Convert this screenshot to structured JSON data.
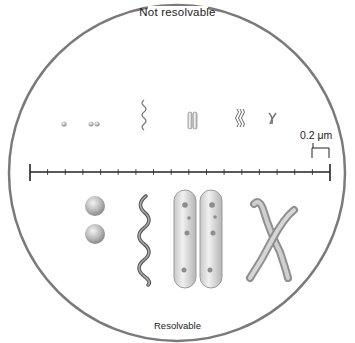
{
  "diagram": {
    "top_label": "Not resolvable",
    "bottom_label": "Resolvable",
    "scale_bar": {
      "label": "0.2 μm",
      "tick_count": 18,
      "bracket_marks_one_interval": true
    },
    "small_structures": [
      {
        "name": "single-coccus"
      },
      {
        "name": "diplococcus"
      },
      {
        "name": "spirillum"
      },
      {
        "name": "bacillus-pair"
      },
      {
        "name": "spirochete-cluster"
      },
      {
        "name": "chromosome"
      }
    ],
    "large_structures": [
      {
        "name": "diplococcus-large"
      },
      {
        "name": "spirillum-large"
      },
      {
        "name": "bacillus-pair-large"
      },
      {
        "name": "chromosome-large"
      }
    ],
    "colors": {
      "outline": "#7a7a7a",
      "structure_fill": "#c9c9c9",
      "structure_shadow": "#9a9a9a",
      "rod_fill": "#e2e2e2",
      "scale_line": "#222222"
    }
  }
}
